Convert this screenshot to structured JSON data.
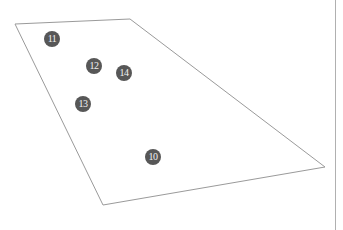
{
  "diagram": {
    "outline": {
      "shape": "quadrilateral",
      "stroke": "#9a9a9a",
      "points": [
        [
          15,
          24
        ],
        [
          130,
          19
        ],
        [
          325,
          167
        ],
        [
          103,
          205
        ]
      ]
    },
    "divider": {
      "x": 335,
      "color": "#b0b0b0"
    },
    "markers": [
      {
        "label": "11",
        "x": 52,
        "y": 39
      },
      {
        "label": "12",
        "x": 94,
        "y": 66
      },
      {
        "label": "14",
        "x": 124,
        "y": 73
      },
      {
        "label": "13",
        "x": 83,
        "y": 104
      },
      {
        "label": "10",
        "x": 153,
        "y": 157
      }
    ],
    "marker_fill": "#575757",
    "marker_text_color": "#f2f2f2"
  }
}
